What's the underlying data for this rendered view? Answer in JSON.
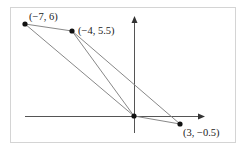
{
  "diagram": {
    "type": "coordinate-plane-triangles",
    "frame": {
      "x": 10,
      "y": 7,
      "width": 225,
      "height": 135,
      "stroke": "#cfcfcf"
    },
    "axes": {
      "origin_px": [
        134,
        116
      ],
      "x_axis": {
        "from": 25,
        "to": 204
      },
      "y_axis": {
        "from": 17,
        "to": 133
      },
      "color": "#555555"
    },
    "points": [
      {
        "id": "A",
        "label": "(−7, 6)",
        "px": [
          25,
          24
        ],
        "label_px": [
          29,
          20
        ]
      },
      {
        "id": "B",
        "label": "(−4, 5.5)",
        "px": [
          72,
          31
        ],
        "label_px": [
          78,
          34
        ]
      },
      {
        "id": "O",
        "label": "",
        "px": [
          134,
          116
        ]
      },
      {
        "id": "C",
        "label": "(3, −0.5)",
        "px": [
          180,
          124
        ],
        "label_px": [
          183,
          136
        ]
      }
    ],
    "segments": [
      [
        "A",
        "B"
      ],
      [
        "A",
        "O"
      ],
      [
        "B",
        "O"
      ],
      [
        "B",
        "C"
      ],
      [
        "O",
        "C"
      ]
    ],
    "line_color": "#888888"
  }
}
